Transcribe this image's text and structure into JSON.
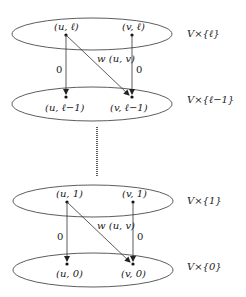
{
  "diagram": {
    "layers": [
      {
        "id": "top",
        "set_label": "V×{ℓ}",
        "u_label": "(u, ℓ)",
        "v_label": "(v, ℓ)"
      },
      {
        "id": "second",
        "set_label": "V×{ℓ−1}",
        "u_label": "(u, ℓ−1)",
        "v_label": "(v, ℓ−1)"
      },
      {
        "id": "third",
        "set_label": "V×{1}",
        "u_label": "(u, 1)",
        "v_label": "(v, 1)"
      },
      {
        "id": "bottom",
        "set_label": "V×{0}",
        "u_label": "(u, 0)",
        "v_label": "(v, 0)"
      }
    ],
    "edges": {
      "vertical_weight": "0",
      "diagonal_weight": "w (u, v)"
    },
    "colors": {
      "stroke": "#333333",
      "text": "#1a1a1a"
    }
  }
}
